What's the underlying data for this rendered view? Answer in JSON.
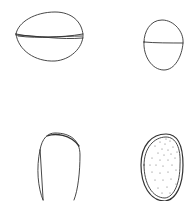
{
  "figure": {
    "stroke_color": "#333333",
    "background": "#ffffff",
    "panels": [
      {
        "id": "top-left",
        "view": "seed lateral view with suture line"
      },
      {
        "id": "top-right",
        "view": "seed end view with suture line"
      },
      {
        "id": "bottom-left",
        "view": "seed outline"
      },
      {
        "id": "bottom-right",
        "view": "seed with stippled surface"
      }
    ]
  }
}
